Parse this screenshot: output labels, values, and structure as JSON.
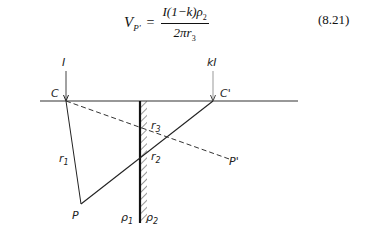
{
  "equation": {
    "lhs": "V",
    "lhs_sub": "P'",
    "equals": "=",
    "numerator": "I(1−k)ρ",
    "numerator_sub": "2",
    "denominator": "2πr",
    "denominator_sub": "3",
    "number": "(8.21)"
  },
  "diagram": {
    "labels": {
      "current_I": "I",
      "current_kI": "kI",
      "source_C": "C",
      "image_C_prime": "C'",
      "r1": "r",
      "r1_sub": "1",
      "r2": "r",
      "r2_sub": "2",
      "r3": "r",
      "r3_sub": "3",
      "point_P": "P",
      "point_P_prime": "P'",
      "rho1": "ρ",
      "rho1_sub": "1",
      "rho2": "ρ",
      "rho2_sub": "2"
    }
  }
}
